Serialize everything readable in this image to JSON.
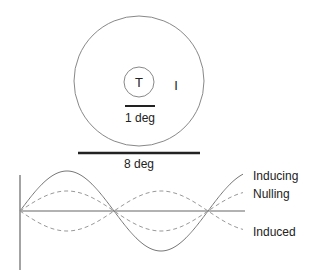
{
  "stimulus": {
    "outer_circle": {
      "cx": 139,
      "cy": 81,
      "r": 65
    },
    "target_circle": {
      "cx": 139,
      "cy": 82,
      "r": 15,
      "label": "T"
    },
    "inducer_label": "I",
    "scale_small": {
      "label": "1 deg",
      "x1": 125,
      "x2": 155,
      "y": 106
    },
    "scale_large": {
      "label": "8 deg",
      "x1": 78,
      "x2": 200,
      "y": 153
    }
  },
  "waveforms": {
    "axis_color": "#666666",
    "curve_color": "#777777",
    "dash_color": "#999999",
    "origin": {
      "x": 20,
      "y": 211
    },
    "period_px": 188,
    "x_end": 243,
    "legend": [
      {
        "label": "Inducing",
        "style": "solid",
        "amplitude": 40,
        "phase": 1
      },
      {
        "label": "Nulling",
        "style": "dashed",
        "amplitude": 20,
        "phase": 1
      },
      {
        "label": "Induced",
        "style": "dashed",
        "amplitude": 20,
        "phase": -1
      }
    ]
  }
}
